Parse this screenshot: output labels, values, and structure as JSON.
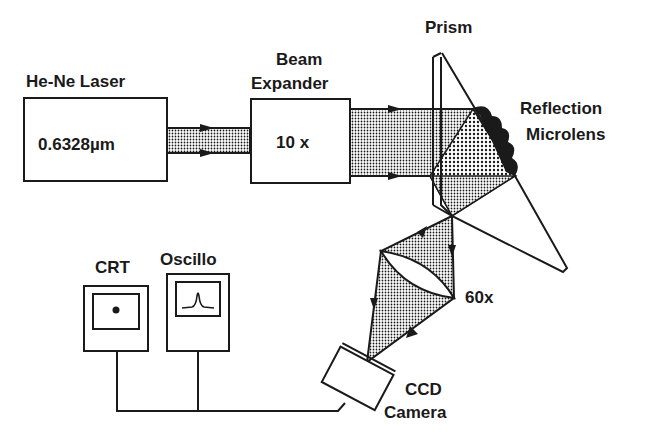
{
  "diagram": {
    "components": {
      "laser": {
        "label": "He-Ne Laser",
        "value": "0.6328µm"
      },
      "beam_expander": {
        "label_line1": "Beam",
        "label_line2": "Expander",
        "value": "10 x"
      },
      "prism": {
        "label": "Prism"
      },
      "microlens": {
        "label_line1": "Reflection",
        "label_line2": "Microlens"
      },
      "objective": {
        "label": "60x"
      },
      "ccd": {
        "label_line1": "CCD",
        "label_line2": "Camera"
      },
      "crt": {
        "label": "CRT"
      },
      "oscillo": {
        "label": "Oscillo"
      }
    },
    "colors": {
      "ink": "#1a1a1a",
      "background": "#ffffff"
    }
  }
}
